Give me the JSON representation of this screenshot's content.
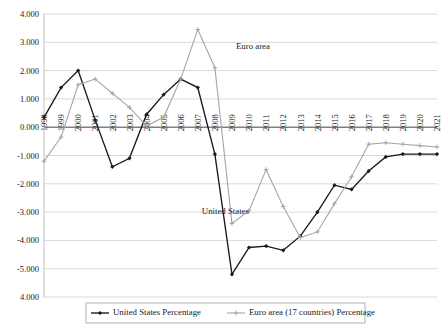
{
  "chart_data": {
    "type": "line",
    "title": "",
    "subtitle": "",
    "xlabel": "",
    "ylabel": "",
    "grid": true,
    "legend_position": "bottom",
    "ylim": [
      -6.0,
      4.0
    ],
    "ytick_step": 1.0,
    "ytick_labels": [
      "4.000",
      "3.000",
      "2.000",
      "1.000",
      "0.000",
      "-1.000",
      "-2.000",
      "-3.000",
      "-4.000",
      "-5.000",
      "4.000"
    ],
    "ytick_values": [
      4.0,
      3.0,
      2.0,
      1.0,
      0.0,
      -1.0,
      -2.0,
      -3.0,
      -4.0,
      -5.0,
      -6.0
    ],
    "categories": [
      "1998",
      "1999",
      "2000",
      "2001",
      "2002",
      "2003",
      "2004",
      "2005",
      "2006",
      "2007",
      "2008",
      "2009",
      "2010",
      "2011",
      "2012",
      "2013",
      "2014",
      "2015",
      "2016",
      "2017",
      "2018",
      "2019",
      "2020",
      "2021"
    ],
    "series": [
      {
        "name": "United States Percentage",
        "color": "#1a1a1a",
        "marker": "diamond",
        "values": [
          0.35,
          1.4,
          2.0,
          0.25,
          -1.4,
          -1.1,
          0.45,
          1.15,
          1.7,
          1.4,
          -0.95,
          -5.2,
          -4.25,
          -4.2,
          -4.35,
          -3.85,
          -3.0,
          -2.05,
          -2.2,
          -1.55,
          -1.05,
          -0.95,
          -0.95,
          -0.95
        ]
      },
      {
        "name": "Euro area (17 countries) Percentage",
        "color": "#a6a6a6",
        "marker": "plus",
        "values": [
          -1.2,
          -0.35,
          1.5,
          1.7,
          1.2,
          0.7,
          0.05,
          0.35,
          1.7,
          3.45,
          2.1,
          -3.4,
          -2.95,
          -1.5,
          -2.8,
          -3.9,
          -3.7,
          -2.7,
          -1.75,
          -0.6,
          -0.55,
          -0.6,
          -0.65,
          -0.7
        ]
      }
    ],
    "annotations": [
      {
        "text": "Euro area",
        "x_year": "2009",
        "y_value": 2.75
      },
      {
        "text": "United States",
        "x_year": "2007",
        "y_value": -3.05
      }
    ]
  },
  "legend": {
    "items": [
      {
        "label": "United States Percentage",
        "marker": "diamond-line",
        "color": "#1a1a1a"
      },
      {
        "label": "Euro area (17 countries) Percentage",
        "marker": "plus-line",
        "color": "#a6a6a6"
      }
    ]
  }
}
